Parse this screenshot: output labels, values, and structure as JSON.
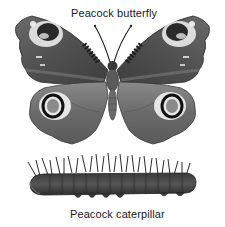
{
  "figure": {
    "labels": {
      "butterfly": "Peacock butterfly",
      "caterpillar": "Peacock caterpillar"
    },
    "illustrations": [
      {
        "name": "peacock-butterfly",
        "style": "grayscale illustration",
        "features": [
          "two forewings with eyespots",
          "two hindwings with eyespots",
          "antennae",
          "body"
        ]
      },
      {
        "name": "peacock-caterpillar",
        "style": "grayscale illustration",
        "features": [
          "spiny segmented body",
          "prolegs"
        ]
      }
    ],
    "colors": {
      "background": "#ffffff",
      "wing_dark": "#4a4a4a",
      "wing_mid": "#6e6e6e",
      "wing_light": "#9a9a9a",
      "eyespot_light": "#e6e6e6",
      "eyespot_dark": "#1c1c1c",
      "text": "#1a1a1a"
    }
  }
}
